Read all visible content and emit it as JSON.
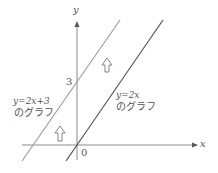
{
  "diagram": {
    "axes": {
      "x_label": "x",
      "y_label": "y",
      "origin_label": "0",
      "y_intercept_tick": "3"
    },
    "lines": [
      {
        "id": "shifted",
        "equation": "y = 2x + 3",
        "caption_eq": "y=2x+3",
        "caption_jp": "のグラフ",
        "color": "#9a9a9a"
      },
      {
        "id": "base",
        "equation": "y = 2x",
        "caption_eq": "y=2x",
        "caption_jp": "のグラフ",
        "color": "#555555"
      }
    ],
    "arrows": [
      {
        "meaning": "upward translation by 3",
        "glyph": "⇧"
      },
      {
        "meaning": "upward translation by 3",
        "glyph": "⇧"
      }
    ]
  }
}
